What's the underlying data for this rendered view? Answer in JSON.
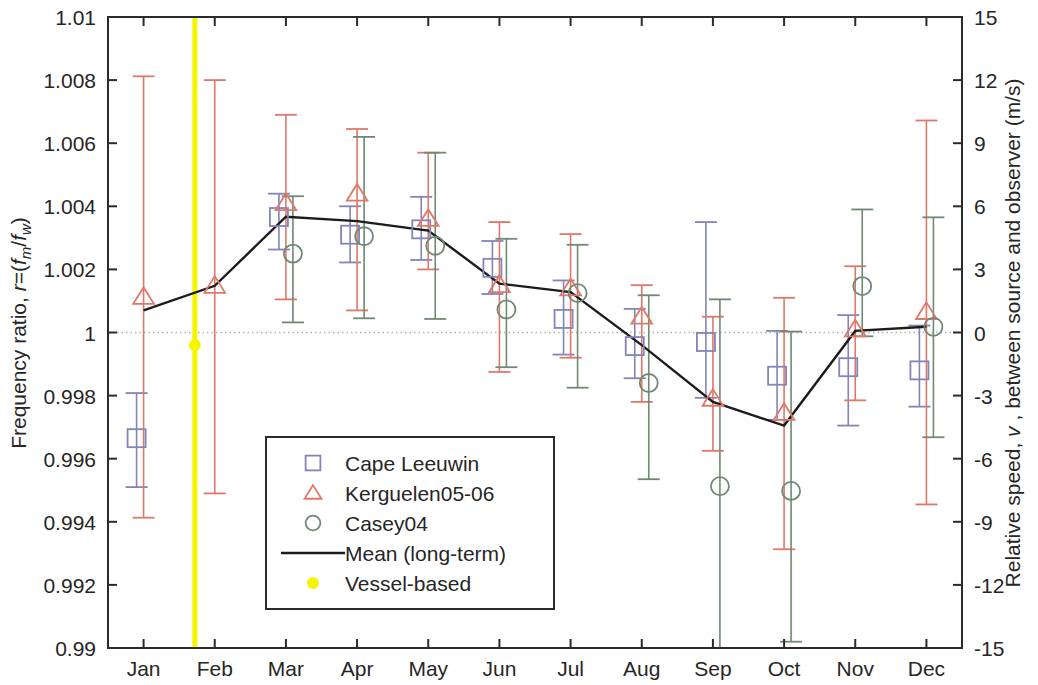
{
  "chart_data": {
    "type": "scatter",
    "title": "",
    "xlabel": "",
    "ylabel": "Frequency ratio, r=(f_m/f_w)",
    "ylabel_parts": {
      "main": "Frequency ratio, ",
      "italic_r": "r",
      "eq": "=(",
      "f1": "f",
      "sub_m": "m",
      "slash": "/",
      "f2": "f",
      "sub_w": "w",
      "close": ")"
    },
    "y2label": "Relative speed, v , between source and observer (m/s)",
    "y2label_parts": {
      "main": "Relative speed, ",
      "italic_v": "v",
      "rest": " , between source and observer (m/s)"
    },
    "categories": [
      "Jan",
      "Feb",
      "Mar",
      "Apr",
      "May",
      "Jun",
      "Jul",
      "Aug",
      "Sep",
      "Oct",
      "Nov",
      "Dec"
    ],
    "ylim": [
      0.99,
      1.01
    ],
    "yticks": [
      0.99,
      0.992,
      0.994,
      0.996,
      0.998,
      1,
      1.002,
      1.004,
      1.006,
      1.008,
      1.01
    ],
    "ytick_labels": [
      "0.99",
      "0.992",
      "0.994",
      "0.996",
      "0.998",
      "1",
      "1.002",
      "1.004",
      "1.006",
      "1.008",
      "1.01"
    ],
    "y2lim": [
      -15,
      15
    ],
    "y2ticks": [
      -15,
      -12,
      -9,
      -6,
      -3,
      0,
      3,
      6,
      9,
      12,
      15
    ],
    "y2tick_labels": [
      "-15",
      "-12",
      "-9",
      "-6",
      "-3",
      "0",
      "3",
      "6",
      "9",
      "12",
      "15"
    ],
    "grid": false,
    "reference_line": {
      "y": 1,
      "style": "dotted",
      "color": "#b0b0b0"
    },
    "legend_position": "lower-left-inside",
    "series": [
      {
        "name": "Cape Leeuwin",
        "marker": "square",
        "color": "#8285b6",
        "points": [
          {
            "x": "Jan",
            "y": 0.99665,
            "lo": 0.9951,
            "hi": 0.99808
          },
          {
            "x": "Feb",
            "y": null,
            "lo": null,
            "hi": null
          },
          {
            "x": "Mar",
            "y": 1.00366,
            "lo": 1.00263,
            "hi": 1.0044
          },
          {
            "x": "Apr",
            "y": 1.0031,
            "lo": 1.00222,
            "hi": 1.004
          },
          {
            "x": "May",
            "y": 1.00327,
            "lo": 1.0023,
            "hi": 1.0043
          },
          {
            "x": "Jun",
            "y": 1.00205,
            "lo": 1.00122,
            "hi": 1.0029
          },
          {
            "x": "Jul",
            "y": 1.00043,
            "lo": 0.9993,
            "hi": 1.00165
          },
          {
            "x": "Aug",
            "y": 0.99957,
            "lo": 0.99855,
            "hi": 1.00075
          },
          {
            "x": "Sep",
            "y": 0.9997,
            "lo": 0.99793,
            "hi": 1.0035
          },
          {
            "x": "Oct",
            "y": 0.99863,
            "lo": 0.99723,
            "hi": 1.00005
          },
          {
            "x": "Nov",
            "y": 0.9989,
            "lo": 0.99705,
            "hi": 1.00055
          },
          {
            "x": "Dec",
            "y": 0.9988,
            "lo": 0.99765,
            "hi": 1.00022
          }
        ]
      },
      {
        "name": "Kerguelen05-06",
        "marker": "triangle",
        "color": "#e0786a",
        "points": [
          {
            "x": "Jan",
            "y": 1.00113,
            "lo": 0.99413,
            "hi": 1.00812
          },
          {
            "x": "Feb",
            "y": 1.00148,
            "lo": 0.9949,
            "hi": 1.008
          },
          {
            "x": "Mar",
            "y": 1.0041,
            "lo": 1.00105,
            "hi": 1.0069
          },
          {
            "x": "Apr",
            "y": 1.0044,
            "lo": 1.0007,
            "hi": 1.00645
          },
          {
            "x": "May",
            "y": 1.0036,
            "lo": 1.002,
            "hi": 1.0057
          },
          {
            "x": "Jun",
            "y": 1.0015,
            "lo": 0.99875,
            "hi": 1.0035
          },
          {
            "x": "Jul",
            "y": 1.0014,
            "lo": 0.9992,
            "hi": 1.00312
          },
          {
            "x": "Aug",
            "y": 1.0005,
            "lo": 0.9978,
            "hi": 1.0015
          },
          {
            "x": "Sep",
            "y": 0.9979,
            "lo": 0.99625,
            "hi": 1.0005
          },
          {
            "x": "Oct",
            "y": 0.99745,
            "lo": 0.99313,
            "hi": 1.0011
          },
          {
            "x": "Nov",
            "y": 1.0001,
            "lo": 0.99785,
            "hi": 1.0021
          },
          {
            "x": "Dec",
            "y": 1.00065,
            "lo": 0.99455,
            "hi": 1.00672
          }
        ]
      },
      {
        "name": "Casey04",
        "marker": "circle",
        "color": "#6f8a72",
        "points": [
          {
            "x": "Jan",
            "y": null,
            "lo": null,
            "hi": null
          },
          {
            "x": "Feb",
            "y": null,
            "lo": null,
            "hi": null
          },
          {
            "x": "Mar",
            "y": 1.0025,
            "lo": 1.00032,
            "hi": 1.00432
          },
          {
            "x": "Apr",
            "y": 1.00305,
            "lo": 1.00045,
            "hi": 1.0062
          },
          {
            "x": "May",
            "y": 1.00275,
            "lo": 1.00043,
            "hi": 1.0057
          },
          {
            "x": "Jun",
            "y": 1.00073,
            "lo": 0.9989,
            "hi": 1.00297
          },
          {
            "x": "Jul",
            "y": 1.00125,
            "lo": 0.99825,
            "hi": 1.00278
          },
          {
            "x": "Aug",
            "y": 0.9984,
            "lo": 0.99535,
            "hi": 1.00118
          },
          {
            "x": "Sep",
            "y": 0.99513,
            "lo": 0.99,
            "hi": 1.00105
          },
          {
            "x": "Oct",
            "y": 0.99498,
            "lo": 0.9902,
            "hi": 1.00003
          },
          {
            "x": "Nov",
            "y": 1.00147,
            "lo": 0.99988,
            "hi": 1.0039
          },
          {
            "x": "Dec",
            "y": 1.00018,
            "lo": 0.99668,
            "hi": 1.00365
          }
        ]
      }
    ],
    "mean_line": {
      "name": "Mean (long-term)",
      "color": "#1c1c1c",
      "values": [
        1.0007,
        1.00148,
        1.00367,
        1.00353,
        1.00323,
        1.00155,
        1.00128,
        0.9996,
        0.9978,
        0.99705,
        1.00005,
        1.00018
      ]
    },
    "vessel_based": {
      "name": "Vessel-based",
      "color": "#f5f500",
      "x": "Feb",
      "x_offset_frac": -0.28,
      "y": 0.9996,
      "vertical_line": true
    }
  },
  "legend": {
    "items": [
      {
        "label": "Cape Leeuwin",
        "marker": "square",
        "color": "#8285b6"
      },
      {
        "label": "Kerguelen05-06",
        "marker": "triangle",
        "color": "#e0786a"
      },
      {
        "label": "Casey04",
        "marker": "circle",
        "color": "#6f8a72"
      },
      {
        "label": "Mean (long-term)",
        "marker": "line",
        "color": "#1c1c1c"
      },
      {
        "label": "Vessel-based",
        "marker": "dot",
        "color": "#f5f500"
      }
    ]
  }
}
